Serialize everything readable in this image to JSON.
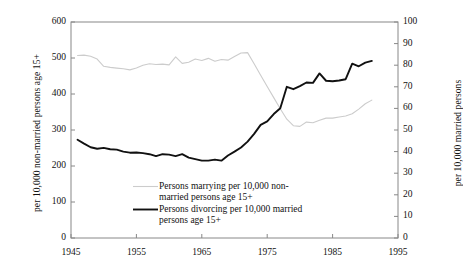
{
  "chart_data": {
    "type": "line",
    "title": "",
    "subtitle": "",
    "xlabel": "",
    "ylabel": "per 10,000 non-married persons age 15+",
    "y2label": "per 10,000 married persons",
    "xlim": [
      1945,
      1995
    ],
    "ylim": [
      0,
      600
    ],
    "y2lim": [
      0,
      100
    ],
    "xticks": [
      1945,
      1955,
      1965,
      1975,
      1985,
      1995
    ],
    "yticks": [
      0,
      100,
      200,
      300,
      400,
      500,
      600
    ],
    "y2ticks": [
      0,
      10,
      20,
      30,
      40,
      50,
      60,
      70,
      80,
      90,
      100
    ],
    "grid": false,
    "legend_position": "inside-lower-center",
    "series": [
      {
        "name": "Persons marrying per 10,000 non-married persons age 15+",
        "axis": "left",
        "color": "#cccccc",
        "x": [
          1946,
          1947,
          1948,
          1949,
          1950,
          1951,
          1952,
          1953,
          1954,
          1955,
          1956,
          1957,
          1958,
          1959,
          1960,
          1961,
          1962,
          1963,
          1964,
          1965,
          1966,
          1967,
          1968,
          1969,
          1970,
          1971,
          1972,
          1973,
          1974,
          1975,
          1976,
          1977,
          1978,
          1979,
          1980,
          1981,
          1982,
          1983,
          1984,
          1985,
          1986,
          1987,
          1988,
          1989,
          1990,
          1991
        ],
        "values": [
          507,
          508,
          505,
          497,
          477,
          474,
          472,
          470,
          467,
          472,
          480,
          484,
          482,
          483,
          481,
          503,
          485,
          488,
          497,
          493,
          499,
          491,
          496,
          494,
          504,
          514,
          515,
          484,
          452,
          421,
          390,
          359,
          330,
          312,
          310,
          322,
          320,
          327,
          333,
          333,
          336,
          339,
          345,
          358,
          373,
          383
        ]
      },
      {
        "name": "Persons divorcing per 10,000 married persons age 15+",
        "axis": "right",
        "color": "#111111",
        "x": [
          1946,
          1947,
          1948,
          1949,
          1950,
          1951,
          1952,
          1953,
          1954,
          1955,
          1956,
          1957,
          1958,
          1959,
          1960,
          1961,
          1962,
          1963,
          1964,
          1965,
          1966,
          1967,
          1968,
          1969,
          1970,
          1971,
          1972,
          1973,
          1974,
          1975,
          1976,
          1977,
          1978,
          1979,
          1980,
          1981,
          1982,
          1983,
          1984,
          1985,
          1986,
          1987,
          1988,
          1989,
          1990,
          1991
        ],
        "values": [
          45.5,
          43.7,
          42.0,
          41.3,
          41.7,
          41.1,
          40.9,
          40.0,
          39.5,
          39.6,
          39.3,
          38.8,
          37.9,
          38.8,
          38.6,
          37.9,
          38.8,
          37.2,
          36.5,
          35.8,
          35.8,
          36.3,
          35.8,
          38.2,
          40.0,
          41.9,
          44.6,
          48.2,
          52.4,
          54.0,
          57.4,
          60.1,
          70.0,
          68.9,
          70.3,
          72.0,
          71.8,
          76.2,
          72.8,
          72.6,
          72.9,
          73.5,
          80.7,
          79.5,
          81.2,
          82.0
        ]
      }
    ]
  },
  "legend": {
    "entries": [
      {
        "swatch": "marrying-line-swatch",
        "line1": "Persons marrying per 10,000 non-",
        "line2": "married persons age 15+"
      },
      {
        "swatch": "divorcing-line-swatch",
        "line1": "Persons divorcing per 10,000 married",
        "line2": "persons age 15+"
      }
    ]
  },
  "colors": {
    "marrying": "#cccccc",
    "divorcing": "#111111",
    "axis": "#888888",
    "text": "#111111"
  }
}
